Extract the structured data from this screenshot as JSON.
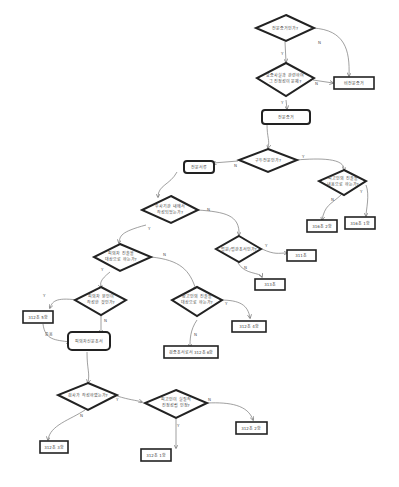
{
  "diagram": {
    "type": "flowchart",
    "language": "ko",
    "nodes": {
      "d1": {
        "text": "전문증거인가?"
      },
      "d2a": {
        "text": "요증사실과 관련하여"
      },
      "d2b": {
        "text": "그 진정성이 문제?"
      },
      "r_non": {
        "text": "비전문증거"
      },
      "s_jeonmun": {
        "text": "전문증거"
      },
      "d3": {
        "text": "구두전문인가?"
      },
      "s_jeonmunseo": {
        "text": "전문서류"
      },
      "d4a": {
        "text": "피고인의 진술을"
      },
      "d4b": {
        "text": "내용으로 하는가?"
      },
      "r_316_2": {
        "text": "316조 2항"
      },
      "r_316_1": {
        "text": "316조 1항"
      },
      "d5a": {
        "text": "수사기관 내에서"
      },
      "d5b": {
        "text": "작성되었는가?"
      },
      "d6": {
        "text": "법원/법관조서인가?"
      },
      "r_311": {
        "text": "311조"
      },
      "r_313": {
        "text": "313조"
      },
      "d7a": {
        "text": "피의자 진술을"
      },
      "d7b": {
        "text": "대상으로 하는가?"
      },
      "d8a": {
        "text": "참고인의 진술을"
      },
      "d8b": {
        "text": "대상으로 하는가?"
      },
      "d9a": {
        "text": "피의자 본인이"
      },
      "d9b": {
        "text": "작성한 것인가?"
      },
      "r_312_5": {
        "text": "312조 5항"
      },
      "r_312_4": {
        "text": "312조 4항"
      },
      "r_312_6": {
        "text": "검증조서로서 312조 6항"
      },
      "s_pisin": {
        "text": "피의자신문조서"
      },
      "d10": {
        "text": "검사가 작성하였는가?"
      },
      "d11a": {
        "text": "피고인이 실질적"
      },
      "d11b": {
        "text": "진정성립 인정?"
      },
      "r_312_1": {
        "text": "312조 1항"
      },
      "r_312_2": {
        "text": "312조 2항"
      },
      "r_312_3": {
        "text": "312조 3항"
      }
    },
    "edge_labels": {
      "yes": "Y",
      "no": "N",
      "includes": "준용"
    }
  }
}
